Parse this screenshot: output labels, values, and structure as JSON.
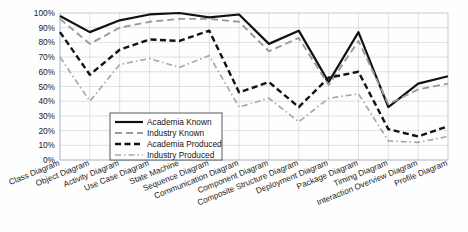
{
  "chart_data": {
    "type": "line",
    "title": "",
    "xlabel": "",
    "ylabel": "",
    "ylim": [
      0,
      100
    ],
    "ytick_suffix": "%",
    "grid": true,
    "legend_position": "inside-lower-left",
    "yticks": [
      "0%",
      "10%",
      "20%",
      "30%",
      "40%",
      "50%",
      "60%",
      "70%",
      "80%",
      "90%",
      "100%"
    ],
    "ytick_values": [
      0,
      10,
      20,
      30,
      40,
      50,
      60,
      70,
      80,
      90,
      100
    ],
    "categories": [
      "Class Diagram",
      "Object Diagram",
      "Activity Diagram",
      "Use Case Diagram",
      "State Machine",
      "Sequence Diagram",
      "Communication Diagram",
      "Component Diagram",
      "Composite Structure Diagram",
      "Deployment Diagram",
      "Package Diagram",
      "Timing Diagram",
      "Interaction Overview Diagram",
      "Profile Diagram"
    ],
    "series": [
      {
        "name": "Academia Known",
        "style": "solid",
        "color": "#111111",
        "width": 2.2,
        "values": [
          98,
          87,
          95,
          99,
          100,
          97,
          99,
          79,
          88,
          53,
          87,
          36,
          52,
          57
        ]
      },
      {
        "name": "Industry Known",
        "style": "dashed",
        "color": "#9a9a9a",
        "width": 1.9,
        "values": [
          96,
          79,
          90,
          94,
          96,
          96,
          94,
          74,
          83,
          51,
          81,
          38,
          48,
          52
        ]
      },
      {
        "name": "Academia Produced",
        "style": "bold-dashed",
        "color": "#111111",
        "width": 2.4,
        "values": [
          87,
          58,
          75,
          82,
          81,
          88,
          46,
          53,
          36,
          56,
          60,
          21,
          16,
          23
        ]
      },
      {
        "name": "Industry Produced",
        "style": "dash-dot",
        "color": "#a8a8a8",
        "width": 1.7,
        "values": [
          70,
          40,
          65,
          69,
          63,
          71,
          36,
          42,
          26,
          42,
          45,
          13,
          12,
          16
        ]
      }
    ]
  },
  "legend": {
    "items": [
      {
        "label": "Academia Known"
      },
      {
        "label": "Industry Known"
      },
      {
        "label": "Academia Produced"
      },
      {
        "label": "Industry Produced"
      }
    ]
  }
}
